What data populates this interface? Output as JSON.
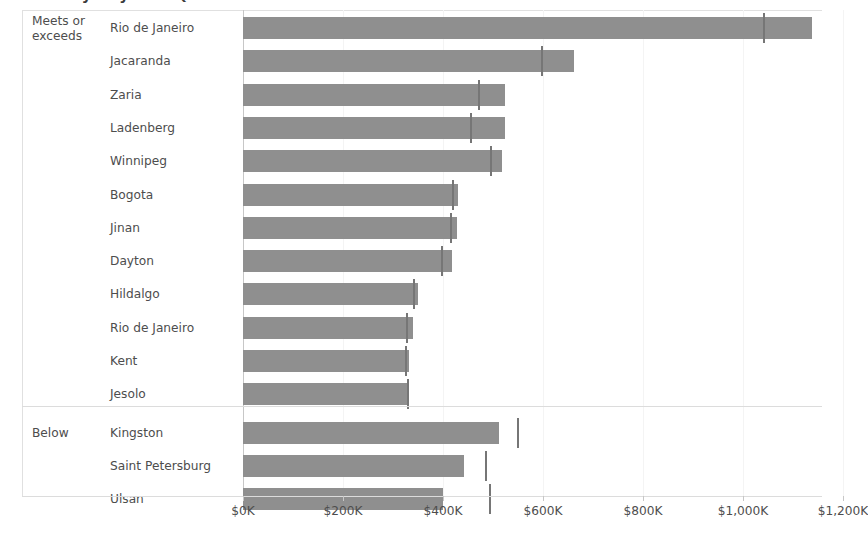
{
  "chart_title": "Sales by City with Quota",
  "axis": {
    "tick_labels": [
      "$0K",
      "$200K",
      "$400K",
      "$600K",
      "$800K",
      "$1,000K",
      "$1,200K"
    ],
    "tick_values": [
      0,
      200000,
      400000,
      600000,
      800000,
      1000000,
      1200000
    ],
    "min": 0,
    "max": 1270000
  },
  "groups": [
    {
      "name": "Meets or\nexceeds",
      "line1": "Meets or",
      "line2": "exceeds"
    },
    {
      "name": "Below",
      "line1": "Below",
      "line2": ""
    }
  ],
  "colors": {
    "bar": "#8f8f8f",
    "reference_marker": "#767676",
    "axis_line": "#c7c7c7",
    "grid": "#f4f4f4",
    "rule": "#dcdcdc",
    "text": "#4d4d4d"
  },
  "chart_data": {
    "type": "bar",
    "orientation": "horizontal",
    "title": "Sales by City with Quota",
    "xlabel": "",
    "ylabel": "",
    "xlim": [
      0,
      1270000
    ],
    "grid": true,
    "legend": "none",
    "value_format": "$#,##0K",
    "series": [
      {
        "name": "Sales",
        "kind": "bar"
      },
      {
        "name": "Quota",
        "kind": "reference-marker"
      }
    ],
    "group_field": "Quota status",
    "categories": [
      "Rio de Janeiro",
      "Jacaranda",
      "Zaria",
      "Ladenberg",
      "Winnipeg",
      "Bogota",
      "Jinan",
      "Dayton",
      "Hildalgo",
      "Rio de Janeiro",
      "Kent",
      "Jesolo",
      "Kingston",
      "Saint Petersburg",
      "Ulsan"
    ],
    "rows": [
      {
        "group": "Meets or exceeds",
        "city": "Rio de Janeiro",
        "sales": 1137000,
        "quota": 1040000
      },
      {
        "group": "Meets or exceeds",
        "city": "Jacaranda",
        "sales": 662000,
        "quota": 596000
      },
      {
        "group": "Meets or exceeds",
        "city": "Zaria",
        "sales": 523000,
        "quota": 469000
      },
      {
        "group": "Meets or exceeds",
        "city": "Ladenberg",
        "sales": 523000,
        "quota": 454000
      },
      {
        "group": "Meets or exceeds",
        "city": "Winnipeg",
        "sales": 518000,
        "quota": 493000
      },
      {
        "group": "Meets or exceeds",
        "city": "Bogota",
        "sales": 430000,
        "quota": 418000
      },
      {
        "group": "Meets or exceeds",
        "city": "Jinan",
        "sales": 428000,
        "quota": 414000
      },
      {
        "group": "Meets or exceeds",
        "city": "Dayton",
        "sales": 418000,
        "quota": 396000
      },
      {
        "group": "Meets or exceeds",
        "city": "Hildalgo",
        "sales": 349000,
        "quota": 340000
      },
      {
        "group": "Meets or exceeds",
        "city": "Rio de Janeiro",
        "sales": 340000,
        "quota": 325000
      },
      {
        "group": "Meets or exceeds",
        "city": "Kent",
        "sales": 331000,
        "quota": 324000
      },
      {
        "group": "Meets or exceeds",
        "city": "Jesolo",
        "sales": 331000,
        "quota": 328000
      },
      {
        "group": "Below",
        "city": "Kingston",
        "sales": 512000,
        "quota": 547000
      },
      {
        "group": "Below",
        "city": "Saint Petersburg",
        "sales": 442000,
        "quota": 483000
      },
      {
        "group": "Below",
        "city": "Ulsan",
        "sales": 400000,
        "quota": 492000
      }
    ]
  }
}
